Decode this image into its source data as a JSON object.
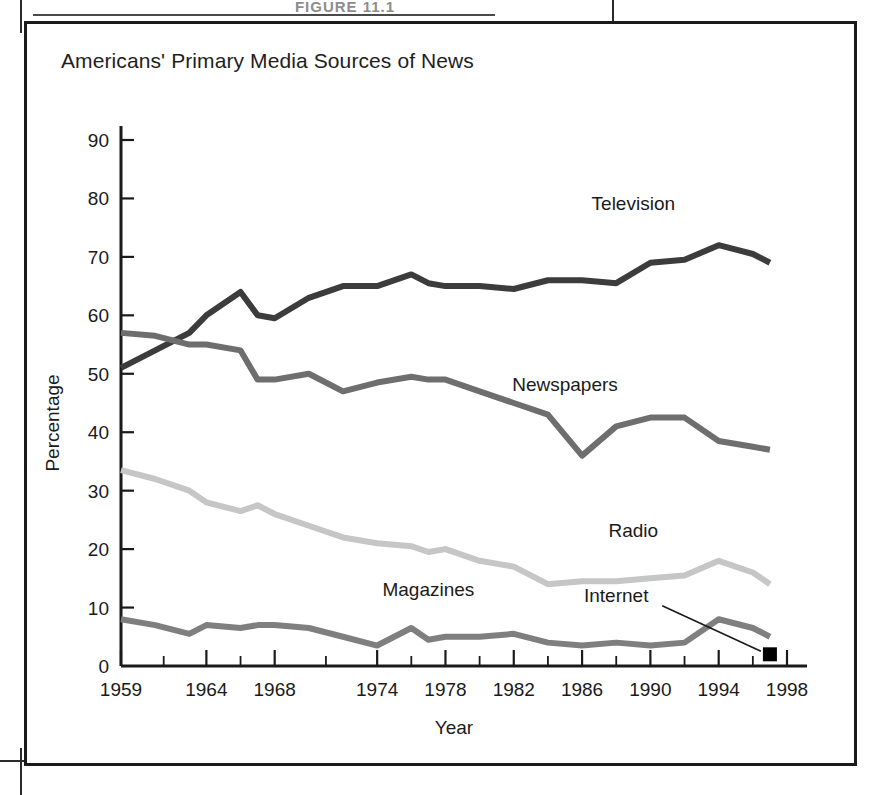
{
  "figure": {
    "caption_top": "FIGURE 11.1",
    "title": "Americans' Primary Media Sources of News"
  },
  "chart_data": {
    "type": "line",
    "title": "Americans' Primary Media Sources of News",
    "xlabel": "Year",
    "ylabel": "Percentage",
    "xlim": [
      1959,
      1998
    ],
    "ylim": [
      0,
      90
    ],
    "ytick_values": [
      0,
      10,
      20,
      30,
      40,
      50,
      60,
      70,
      80,
      90
    ],
    "ytick_labels": [
      "0",
      "10",
      "20",
      "30",
      "40",
      "50",
      "60",
      "70",
      "80",
      "90"
    ],
    "xtick_labels": [
      "1959",
      "1964",
      "1968",
      "1974",
      "1978",
      "1982",
      "1986",
      "1990",
      "1994",
      "1998"
    ],
    "xtick_values": [
      1959,
      1964,
      1968,
      1974,
      1978,
      1982,
      1986,
      1990,
      1994,
      1998
    ],
    "grid": false,
    "legend": "inline-labels",
    "x": [
      1959,
      1961,
      1963,
      1964,
      1966,
      1967,
      1968,
      1970,
      1972,
      1974,
      1976,
      1977,
      1978,
      1980,
      1982,
      1984,
      1986,
      1988,
      1990,
      1992,
      1994,
      1996,
      1997
    ],
    "series": [
      {
        "name": "Television",
        "color": "#3c3c3c",
        "width": 6,
        "label_x": 1989,
        "label_y": 78,
        "values": [
          51,
          54,
          57,
          60,
          64,
          60,
          59.5,
          63,
          65,
          65,
          67,
          65.5,
          65,
          65,
          64.5,
          66,
          66,
          65.5,
          69,
          69.5,
          72,
          70.5,
          69
        ]
      },
      {
        "name": "Newspapers",
        "color": "#6e6e6e",
        "width": 6,
        "label_x": 1985,
        "label_y": 47,
        "values": [
          57,
          56.5,
          55,
          55,
          54,
          49,
          49,
          50,
          47,
          48.5,
          49.5,
          49,
          49,
          47,
          45,
          43,
          36,
          41,
          42.5,
          42.5,
          38.5,
          37.5,
          37
        ]
      },
      {
        "name": "Radio",
        "color": "#c6c6c6",
        "width": 6,
        "label_x": 1989,
        "label_y": 22,
        "values": [
          33.5,
          32,
          30,
          28,
          26.5,
          27.5,
          26,
          24,
          22,
          21,
          20.5,
          19.5,
          20,
          18,
          17,
          14,
          14.5,
          14.5,
          15,
          15.5,
          18,
          16,
          14
        ]
      },
      {
        "name": "Magazines",
        "color": "#7f7f7f",
        "width": 6,
        "label_x": 1977,
        "label_y": 12,
        "values": [
          8,
          7,
          5.5,
          7,
          6.5,
          7,
          7,
          6.5,
          5,
          3.5,
          6.5,
          4.5,
          5,
          5,
          5.5,
          4,
          3.5,
          4,
          3.5,
          4,
          8,
          6.5,
          5
        ]
      }
    ],
    "point_series": [
      {
        "name": "Internet",
        "color": "#000000",
        "marker": "square",
        "label_x": 1988,
        "label_y": 11,
        "points": [
          {
            "x": 1997,
            "y": 2
          }
        ]
      }
    ]
  }
}
